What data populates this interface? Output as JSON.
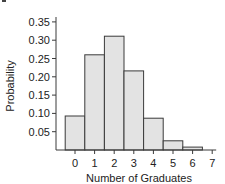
{
  "chart_data": {
    "type": "bar",
    "title": "",
    "xlabel": "Number of Graduates",
    "ylabel": "Probability",
    "categories": [
      "0",
      "1",
      "2",
      "3",
      "4",
      "5",
      "6",
      "7"
    ],
    "values": [
      0.093,
      0.26,
      0.311,
      0.216,
      0.087,
      0.025,
      0.008,
      0.0005
    ],
    "ylim": [
      0,
      0.37
    ],
    "yticks": [
      "0.05",
      "0.10",
      "0.15",
      "0.20",
      "0.25",
      "0.30",
      "0.35"
    ],
    "ytick_values": [
      0.05,
      0.1,
      0.15,
      0.2,
      0.25,
      0.3,
      0.35
    ],
    "grid": false,
    "legend": null,
    "bar_fill": "#e3e3e3",
    "bar_stroke": "#3a3a3a"
  }
}
